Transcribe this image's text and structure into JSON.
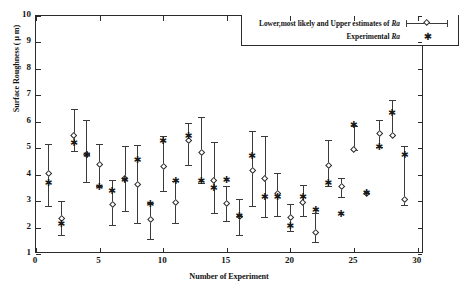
{
  "figure": {
    "background": "#ffffff",
    "frame_color": "#2b2b2b"
  },
  "legend": {
    "entries": [
      {
        "label_pre": "Lower,most likely and Upper estimates of ",
        "label_italic": "Ra",
        "marker": "errorbar-diamond"
      },
      {
        "label_pre": "Experimental ",
        "label_italic": "Ra",
        "marker": "asterisk"
      }
    ],
    "star_glyph": "✱"
  },
  "chart_data": {
    "type": "scatter",
    "title": "",
    "xlabel": "Number of Experiment",
    "ylabel": "Surface Roughness ( μ m)",
    "xlim": [
      0,
      30.5
    ],
    "ylim": [
      1,
      10
    ],
    "xticks": [
      0,
      5,
      10,
      15,
      20,
      25,
      30
    ],
    "xtick_labels": [
      "0",
      "5",
      "10",
      "15",
      "20",
      "25",
      "30"
    ],
    "yticks": [
      1,
      2,
      3,
      4,
      5,
      6,
      7,
      8,
      9,
      10
    ],
    "ytick_labels": [
      "1",
      "2",
      "3",
      "4",
      "5",
      "6",
      "7",
      "8",
      "9",
      "10"
    ],
    "grid": false,
    "legend_position": "top-right",
    "x": [
      1,
      2,
      3,
      4,
      5,
      6,
      7,
      8,
      9,
      10,
      11,
      12,
      13,
      14,
      15,
      16,
      17,
      18,
      19,
      20,
      21,
      22,
      23,
      24,
      25,
      26,
      27,
      28,
      29
    ],
    "series": [
      {
        "name": "Lower,most likely and Upper estimates of Ra",
        "marker": "diamond",
        "values": [
          4.05,
          2.35,
          5.48,
          4.75,
          4.36,
          2.86,
          3.83,
          3.62,
          2.29,
          4.3,
          2.93,
          5.28,
          4.82,
          3.79,
          2.89,
          2.4,
          4.16,
          3.86,
          3.28,
          2.39,
          2.95,
          1.8,
          4.33,
          3.55,
          4.93,
          3.29,
          5.54,
          5.49,
          3.05
        ],
        "lower": [
          2.82,
          1.72,
          4.88,
          3.73,
          3.56,
          2.11,
          2.61,
          2.16,
          1.57,
          3.38,
          2.18,
          4.38,
          3.69,
          2.54,
          2.24,
          1.72,
          2.81,
          2.39,
          2.42,
          1.88,
          2.45,
          1.45,
          3.56,
          3.16,
          4.93,
          3.29,
          5.03,
          5.49,
          2.84
        ],
        "upper": [
          5.16,
          2.99,
          6.47,
          6.06,
          5.17,
          3.81,
          5.1,
          5.13,
          2.93,
          5.48,
          3.76,
          5.94,
          6.17,
          5.24,
          3.59,
          3.08,
          5.64,
          5.47,
          4.08,
          2.9,
          3.6,
          2.55,
          5.32,
          3.89,
          5.84,
          3.29,
          6.06,
          6.83,
          5.1
        ]
      },
      {
        "name": "Experimental Ra",
        "marker": "asterisk",
        "values": [
          3.67,
          2.13,
          5.19,
          4.73,
          3.53,
          3.35,
          3.76,
          4.53,
          2.86,
          5.25,
          3.74,
          5.43,
          3.75,
          3.47,
          3.77,
          2.41,
          4.68,
          3.13,
          3.12,
          2.03,
          3.14,
          2.63,
          3.68,
          2.49,
          5.84,
          3.29,
          5.03,
          6.31,
          4.72
        ]
      }
    ]
  }
}
